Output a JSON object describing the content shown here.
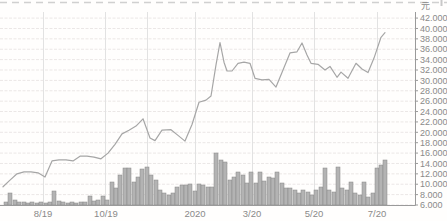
{
  "chart_data": {
    "type": "line",
    "subtype": "price-line-with-volume-bars",
    "title": "",
    "unit_label": "元",
    "legend": [],
    "grid": true,
    "legend_position": "none",
    "y_axis": {
      "side": "right",
      "min": 6.0,
      "max": 42.0,
      "step": 2.0,
      "tick_labels": [
        "42.000",
        "40.000",
        "38.000",
        "36.000",
        "34.000",
        "32.000",
        "30.000",
        "28.000",
        "26.000",
        "24.000",
        "22.000",
        "20.000",
        "18.000",
        "16.000",
        "14.000",
        "12.000",
        "10.000",
        "8.000",
        "6.000"
      ]
    },
    "x_axis": {
      "tick_labels": [
        "8/19",
        "10/19",
        "2020",
        "3/20",
        "5/20",
        "7/20"
      ],
      "tick_x": [
        43,
        106,
        195,
        252,
        314,
        377
      ],
      "extra_gridline_x": [
        43,
        105,
        147,
        195,
        252,
        314,
        377
      ]
    },
    "price_series": {
      "name": "price",
      "points_x_value": [
        [
          3,
          9.5
        ],
        [
          10,
          10.8
        ],
        [
          17,
          12.0
        ],
        [
          24,
          12.4
        ],
        [
          31,
          12.4
        ],
        [
          38,
          12.2
        ],
        [
          45,
          11.4
        ],
        [
          52,
          14.5
        ],
        [
          59,
          14.7
        ],
        [
          66,
          14.7
        ],
        [
          73,
          14.5
        ],
        [
          80,
          15.4
        ],
        [
          87,
          15.4
        ],
        [
          94,
          15.2
        ],
        [
          101,
          14.9
        ],
        [
          108,
          16.0
        ],
        [
          115,
          17.7
        ],
        [
          122,
          19.7
        ],
        [
          129,
          20.4
        ],
        [
          136,
          21.2
        ],
        [
          143,
          22.6
        ],
        [
          150,
          18.9
        ],
        [
          155,
          18.4
        ],
        [
          162,
          20.4
        ],
        [
          171,
          20.5
        ],
        [
          178,
          19.4
        ],
        [
          185,
          18.3
        ],
        [
          192,
          21.5
        ],
        [
          199,
          25.8
        ],
        [
          206,
          26.2
        ],
        [
          211,
          27.0
        ],
        [
          216,
          33.0
        ],
        [
          220,
          37.3
        ],
        [
          224,
          33.5
        ],
        [
          227,
          31.8
        ],
        [
          232,
          31.8
        ],
        [
          238,
          33.3
        ],
        [
          244,
          33.5
        ],
        [
          250,
          33.3
        ],
        [
          255,
          30.4
        ],
        [
          262,
          30.1
        ],
        [
          269,
          30.2
        ],
        [
          276,
          28.7
        ],
        [
          283,
          32.0
        ],
        [
          290,
          35.3
        ],
        [
          297,
          35.5
        ],
        [
          302,
          37.2
        ],
        [
          307,
          34.9
        ],
        [
          311,
          33.3
        ],
        [
          318,
          33.1
        ],
        [
          325,
          32.0
        ],
        [
          330,
          32.7
        ],
        [
          337,
          30.6
        ],
        [
          341,
          31.6
        ],
        [
          348,
          30.4
        ],
        [
          356,
          33.3
        ],
        [
          362,
          32.2
        ],
        [
          368,
          31.5
        ],
        [
          374,
          34.3
        ],
        [
          381,
          38.3
        ],
        [
          385,
          39.2
        ]
      ]
    },
    "volume_series": {
      "name": "volume",
      "bar_width_px": 4,
      "bars_x_heightpx": [
        [
          6,
          3
        ],
        [
          10,
          12
        ],
        [
          15,
          5
        ],
        [
          19,
          3
        ],
        [
          24,
          3
        ],
        [
          28,
          2
        ],
        [
          32,
          3
        ],
        [
          37,
          2
        ],
        [
          41,
          3
        ],
        [
          46,
          2
        ],
        [
          50,
          3
        ],
        [
          54,
          14
        ],
        [
          59,
          4
        ],
        [
          63,
          3
        ],
        [
          68,
          2
        ],
        [
          72,
          3
        ],
        [
          76,
          2
        ],
        [
          81,
          3
        ],
        [
          85,
          3
        ],
        [
          90,
          9
        ],
        [
          94,
          4
        ],
        [
          98,
          5
        ],
        [
          103,
          9
        ],
        [
          107,
          5
        ],
        [
          112,
          23
        ],
        [
          116,
          17
        ],
        [
          120,
          30
        ],
        [
          125,
          37
        ],
        [
          129,
          37
        ],
        [
          134,
          23
        ],
        [
          138,
          28
        ],
        [
          142,
          36
        ],
        [
          147,
          38
        ],
        [
          151,
          30
        ],
        [
          156,
          25
        ],
        [
          160,
          15
        ],
        [
          164,
          12
        ],
        [
          169,
          10
        ],
        [
          173,
          12
        ],
        [
          177,
          18
        ],
        [
          182,
          20
        ],
        [
          186,
          20
        ],
        [
          190,
          21
        ],
        [
          195,
          14
        ],
        [
          199,
          21
        ],
        [
          203,
          20
        ],
        [
          208,
          18
        ],
        [
          212,
          18
        ],
        [
          216,
          52
        ],
        [
          221,
          45
        ],
        [
          225,
          43
        ],
        [
          230,
          25
        ],
        [
          234,
          28
        ],
        [
          238,
          33
        ],
        [
          243,
          30
        ],
        [
          247,
          22
        ],
        [
          251,
          33
        ],
        [
          256,
          22
        ],
        [
          260,
          33
        ],
        [
          264,
          24
        ],
        [
          269,
          28
        ],
        [
          273,
          27
        ],
        [
          277,
          33
        ],
        [
          282,
          22
        ],
        [
          286,
          17
        ],
        [
          290,
          17
        ],
        [
          295,
          15
        ],
        [
          299,
          12
        ],
        [
          303,
          15
        ],
        [
          308,
          13
        ],
        [
          312,
          10
        ],
        [
          316,
          15
        ],
        [
          321,
          18
        ],
        [
          325,
          37
        ],
        [
          329,
          15
        ],
        [
          334,
          13
        ],
        [
          338,
          38
        ],
        [
          342,
          17
        ],
        [
          347,
          15
        ],
        [
          351,
          23
        ],
        [
          355,
          12
        ],
        [
          360,
          10
        ],
        [
          364,
          23
        ],
        [
          368,
          8
        ],
        [
          373,
          12
        ],
        [
          377,
          37
        ],
        [
          381,
          40
        ],
        [
          385,
          45
        ]
      ]
    },
    "layout": {
      "axis_x": 415,
      "baseline_y": 205.5,
      "top_y": 12,
      "px_per_unit": 5.192
    },
    "colors": {
      "background": "#fffefd",
      "price_line": "#a6a6a6",
      "bar_fill": "#b3b3b3",
      "bar_stroke": "#878787",
      "grid_h": "#ebe7e6",
      "grid_v": "#e2e2e2",
      "axis": "#9a9a9a",
      "tick_text": "#8a8a8a",
      "top_dashed": "#d0d0d0"
    }
  }
}
